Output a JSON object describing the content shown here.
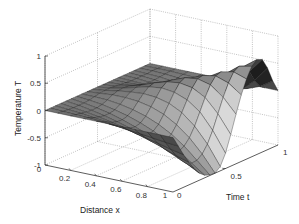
{
  "chart_data": {
    "type": "surface",
    "title": "",
    "xlabel": "Distance x",
    "ylabel": "Time t",
    "zlabel": "Temperature T",
    "xlim": [
      0,
      1
    ],
    "ylim": [
      0,
      1
    ],
    "zlim": [
      -1,
      1
    ],
    "x_ticks": [
      "0",
      "0.2",
      "0.4",
      "0.6",
      "0.8",
      "1"
    ],
    "t_ticks": [
      "0",
      "0.5",
      "1"
    ],
    "z_ticks": [
      "-1",
      "-0.5",
      "0",
      "0.5",
      "1"
    ],
    "grid": true,
    "colormap": "gray",
    "x": [
      0,
      0.1,
      0.2,
      0.3,
      0.4,
      0.5,
      0.6,
      0.7,
      0.8,
      0.9,
      1.0
    ],
    "t": [
      0,
      0.05,
      0.1,
      0.15,
      0.2,
      0.25,
      0.3,
      0.35,
      0.4,
      0.45,
      0.5,
      0.55,
      0.6,
      0.65,
      0.7,
      0.75,
      0.8,
      0.85,
      0.9,
      0.95,
      1.0
    ],
    "T_description": "T[i][j] for t[i], x[j]; T=0 at x=0 and at t=0; trough near (x=1,t=0.45) ≈ -1; ridge peak near (x=1,t=0.85) ≈ 0.75",
    "T": [
      [
        0,
        0,
        0,
        0,
        0,
        0,
        0,
        0,
        0,
        0,
        0
      ],
      [
        0,
        -0.01,
        -0.02,
        -0.03,
        -0.05,
        -0.07,
        -0.09,
        -0.12,
        -0.15,
        -0.18,
        -0.2
      ],
      [
        0,
        -0.02,
        -0.04,
        -0.07,
        -0.1,
        -0.14,
        -0.18,
        -0.23,
        -0.29,
        -0.35,
        -0.4
      ],
      [
        0,
        -0.03,
        -0.06,
        -0.1,
        -0.15,
        -0.2,
        -0.27,
        -0.34,
        -0.42,
        -0.51,
        -0.58
      ],
      [
        0,
        -0.03,
        -0.07,
        -0.12,
        -0.18,
        -0.25,
        -0.33,
        -0.42,
        -0.53,
        -0.64,
        -0.74
      ],
      [
        0,
        -0.03,
        -0.07,
        -0.12,
        -0.19,
        -0.27,
        -0.36,
        -0.47,
        -0.6,
        -0.74,
        -0.87
      ],
      [
        0,
        -0.02,
        -0.05,
        -0.1,
        -0.16,
        -0.24,
        -0.34,
        -0.46,
        -0.61,
        -0.78,
        -0.95
      ],
      [
        0,
        0.0,
        -0.01,
        -0.04,
        -0.09,
        -0.16,
        -0.26,
        -0.39,
        -0.56,
        -0.77,
        -0.99
      ],
      [
        0,
        0.02,
        0.04,
        0.04,
        0.02,
        -0.03,
        -0.12,
        -0.26,
        -0.45,
        -0.7,
        -1.0
      ],
      [
        0,
        0.03,
        0.07,
        0.1,
        0.12,
        0.1,
        0.04,
        -0.08,
        -0.28,
        -0.56,
        -0.92
      ],
      [
        0,
        0.03,
        0.08,
        0.14,
        0.2,
        0.23,
        0.2,
        0.11,
        -0.06,
        -0.35,
        -0.72
      ],
      [
        0,
        0.02,
        0.07,
        0.14,
        0.23,
        0.3,
        0.33,
        0.29,
        0.16,
        -0.09,
        -0.42
      ],
      [
        0,
        0.01,
        0.04,
        0.1,
        0.19,
        0.29,
        0.38,
        0.41,
        0.35,
        0.17,
        -0.09
      ],
      [
        0,
        0.0,
        0.01,
        0.04,
        0.11,
        0.21,
        0.33,
        0.43,
        0.47,
        0.39,
        0.22
      ],
      [
        0,
        -0.01,
        -0.02,
        -0.02,
        0.02,
        0.1,
        0.22,
        0.36,
        0.5,
        0.55,
        0.47
      ],
      [
        0,
        -0.01,
        -0.03,
        -0.05,
        -0.05,
        -0.01,
        0.08,
        0.23,
        0.43,
        0.61,
        0.66
      ],
      [
        0,
        -0.01,
        -0.03,
        -0.06,
        -0.08,
        -0.08,
        -0.03,
        0.09,
        0.3,
        0.57,
        0.74
      ],
      [
        0,
        -0.01,
        -0.02,
        -0.05,
        -0.08,
        -0.1,
        -0.09,
        -0.02,
        0.15,
        0.43,
        0.7
      ],
      [
        0,
        0.0,
        -0.01,
        -0.03,
        -0.05,
        -0.08,
        -0.09,
        -0.07,
        0.02,
        0.22,
        0.5
      ],
      [
        0,
        0.0,
        0.0,
        -0.01,
        -0.02,
        -0.04,
        -0.05,
        -0.05,
        -0.02,
        0.07,
        0.22
      ],
      [
        0,
        0,
        0,
        0,
        0,
        0,
        0,
        0,
        0,
        0,
        0
      ]
    ]
  },
  "projection": {
    "origin": [
      45,
      165
    ],
    "x_vec": [
      128,
      27
    ],
    "t_vec": [
      105,
      -47
    ],
    "z_unit_px": 54.5
  },
  "colors": {
    "axis": "#333333",
    "grid": "#9a9a9a",
    "edge": "#1a1a1a",
    "background": "#ffffff"
  }
}
